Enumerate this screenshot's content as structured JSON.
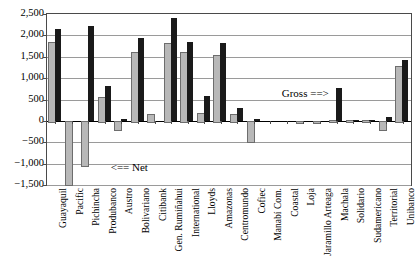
{
  "chart_data": {
    "type": "bar",
    "title": "",
    "subtitle": "",
    "xlabel": "",
    "ylabel": "",
    "ylim": [
      -1500,
      2500
    ],
    "ytick_step": 500,
    "grid": true,
    "legend_position": "inline-annotations",
    "ytick_labels": [
      "2,500",
      "2,000",
      "1,500",
      "1,000",
      "500",
      "0",
      "−500",
      "−1,000",
      "−1,500"
    ],
    "ytick_values": [
      2500,
      2000,
      1500,
      1000,
      500,
      0,
      -500,
      -1000,
      -1500
    ],
    "categories": [
      "Guayaquil",
      "Pacific",
      "Pichincha",
      "Produbanco",
      "Austro",
      "Bolivariano",
      "Citibank",
      "Gen. Rumiñahui",
      "International",
      "Lloyds",
      "Amazonas",
      "Centromundo",
      "Cofiec",
      "Manabí Com.",
      "Coastal",
      "Loja",
      "Jaramillo Arteaga",
      "Machala",
      "Solidario",
      "Sudamericano",
      "Territorial",
      "Unibanco"
    ],
    "series": [
      {
        "name": "Net",
        "color": "#b8b8b8",
        "values": [
          1840,
          -1480,
          -1030,
          550,
          -200,
          1620,
          150,
          1810,
          1620,
          180,
          1530,
          160,
          -460,
          0,
          0,
          -20,
          -20,
          30,
          20,
          10,
          -180,
          1290
        ]
      },
      {
        "name": "Gross",
        "color": "#1a1a1a",
        "values": [
          2140,
          0,
          2230,
          810,
          40,
          1950,
          0,
          2410,
          1850,
          590,
          1830,
          310,
          40,
          0,
          0,
          0,
          0,
          780,
          10,
          10,
          80,
          1420
        ]
      }
    ],
    "annotations": [
      {
        "id": "net-annotation",
        "text": "<==  Net",
        "x_frac": 0.175,
        "y_value": -1100
      },
      {
        "id": "gross-annotation",
        "text": "Gross  ==>",
        "x_frac": 0.645,
        "y_value": 640
      }
    ]
  }
}
